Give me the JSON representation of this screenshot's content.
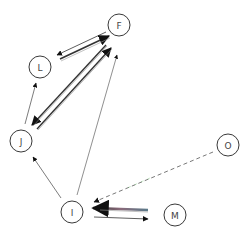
{
  "diagram": {
    "type": "directed-graph",
    "nodes": [
      {
        "id": "F",
        "label": "F",
        "x": 119,
        "y": 25
      },
      {
        "id": "L",
        "label": "L",
        "x": 40,
        "y": 67
      },
      {
        "id": "J",
        "label": "J",
        "x": 21,
        "y": 141
      },
      {
        "id": "O",
        "label": "O",
        "x": 228,
        "y": 145
      },
      {
        "id": "I",
        "label": "I",
        "x": 72,
        "y": 212
      },
      {
        "id": "M",
        "label": "M",
        "x": 175,
        "y": 215
      }
    ],
    "edges": [
      {
        "from": "F",
        "to": "L",
        "style": "double"
      },
      {
        "from": "L",
        "to": "F",
        "style": "double"
      },
      {
        "from": "F",
        "to": "J",
        "style": "double"
      },
      {
        "from": "J",
        "to": "F",
        "style": "double"
      },
      {
        "from": "J",
        "to": "L",
        "style": "solid"
      },
      {
        "from": "I",
        "to": "J",
        "style": "solid"
      },
      {
        "from": "I",
        "to": "F",
        "style": "solid"
      },
      {
        "from": "O",
        "to": "I",
        "style": "dashed"
      },
      {
        "from": "M",
        "to": "I",
        "style": "thick"
      },
      {
        "from": "I",
        "to": "M",
        "style": "solid"
      }
    ]
  }
}
